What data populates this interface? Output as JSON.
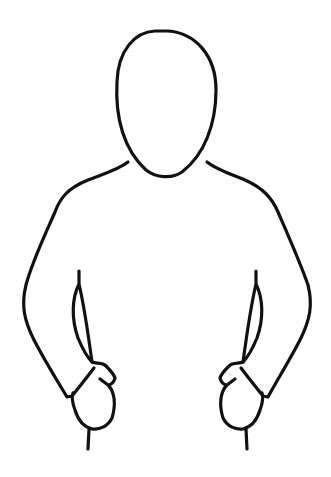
{
  "figure": {
    "description": "Blank person body outline line drawing (head, shoulders, arms, fists)",
    "line_color": "#111111",
    "background_color": "#ffffff",
    "parts": [
      "head",
      "left-shoulder-arm",
      "right-shoulder-arm",
      "left-inner-arm",
      "right-inner-arm",
      "left-fist",
      "right-fist"
    ]
  }
}
